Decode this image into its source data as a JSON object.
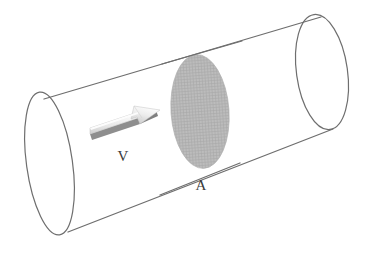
{
  "figure": {
    "background_color": "#ffffff",
    "outline_color": "#6e6e6e",
    "outline_width": 1.2,
    "cross_section_fill": "#b6b6b6",
    "cross_section_hatch_color": "#a6a6a6",
    "arrow_body_color": "#d8d8d8",
    "arrow_highlight_color": "#f0f0f0",
    "arrow_shadow_color": "#8c8c8c",
    "label_color": "#3a3a3a"
  },
  "labels": {
    "velocity": "V",
    "area": "A"
  },
  "geometry": {
    "left_cap": {
      "center_x": 49.5,
      "center_y": 163.5,
      "radius_x": 23,
      "radius_y": 72,
      "rotation_deg": -8
    },
    "right_cap": {
      "center_x": 322,
      "center_y": 72,
      "radius_x": 25.5,
      "radius_y": 58,
      "rotation_deg": -8
    },
    "cross_section": {
      "center_x": 200,
      "center_y": 111.5,
      "radius_x": 29,
      "radius_y": 57,
      "rotation_deg": -4
    },
    "top_edge": {
      "x1": 44,
      "y1": 99,
      "x2": 321,
      "y2": 17
    },
    "bottom_edge": {
      "x1": 68,
      "y1": 232,
      "x2": 333,
      "y2": 129
    },
    "arrow": {
      "tail_x": 92,
      "tail_y": 135,
      "tip_x": 160,
      "tip_y": 111,
      "label_x": 123,
      "label_y": 161
    },
    "area_label": {
      "x": 201,
      "y": 190
    }
  },
  "elements": {
    "cylinder_name": "cylinder-pipe",
    "left_cap_name": "cylinder-left-end-cap",
    "right_cap_name": "cylinder-right-end-cap",
    "cross_section_name": "cross-section-ellipse",
    "arrow_name": "velocity-arrow"
  }
}
